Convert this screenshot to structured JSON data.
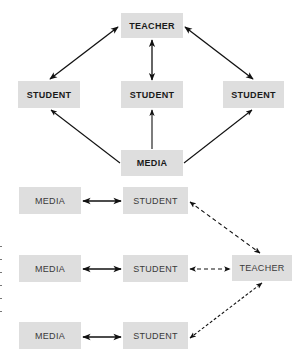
{
  "diagram_top": {
    "teacher": "TEACHER",
    "students": [
      "STUDENT",
      "STUDENT",
      "STUDENT"
    ],
    "media": "MEDIA",
    "edges": [
      {
        "from": "TEACHER",
        "to": "STUDENT (left)",
        "style": "solid",
        "direction": "both"
      },
      {
        "from": "TEACHER",
        "to": "STUDENT (middle)",
        "style": "solid",
        "direction": "both"
      },
      {
        "from": "TEACHER",
        "to": "STUDENT (right)",
        "style": "solid",
        "direction": "both"
      },
      {
        "from": "MEDIA",
        "to": "STUDENT (left)",
        "style": "solid",
        "direction": "forward"
      },
      {
        "from": "MEDIA",
        "to": "STUDENT (middle)",
        "style": "solid",
        "direction": "forward"
      },
      {
        "from": "MEDIA",
        "to": "STUDENT (right)",
        "style": "solid",
        "direction": "forward"
      }
    ]
  },
  "diagram_bottom": {
    "rows": [
      {
        "media": "MEDIA",
        "student": "STUDENT"
      },
      {
        "media": "MEDIA",
        "student": "STUDENT"
      },
      {
        "media": "MEDIA",
        "student": "STUDENT"
      }
    ],
    "teacher": "TEACHER",
    "edges": [
      {
        "from": "MEDIA",
        "to": "STUDENT",
        "style": "solid",
        "direction": "both"
      },
      {
        "from": "STUDENT",
        "to": "TEACHER",
        "style": "dashed",
        "direction": "both"
      }
    ]
  },
  "colors": {
    "box_fill": "#dedede",
    "arrow": "#111111",
    "text": "#222222"
  }
}
